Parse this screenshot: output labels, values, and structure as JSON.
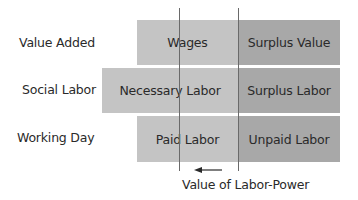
{
  "diagram": {
    "rows": [
      {
        "label": "Value Added",
        "left": {
          "text": "Wages",
          "color": "#c4c4c4"
        },
        "right": {
          "text": "Surplus Value",
          "color": "#a8a8a8"
        }
      },
      {
        "label": "Social Labor",
        "left": {
          "text": "Necessary Labor",
          "color": "#c4c4c4"
        },
        "right": {
          "text": "Surplus Labor",
          "color": "#a8a8a8"
        }
      },
      {
        "label": "Working Day",
        "left": {
          "text": "Paid Labor",
          "color": "#c4c4c4"
        },
        "right": {
          "text": "Unpaid Labor",
          "color": "#a8a8a8"
        }
      }
    ],
    "caption": "Value of Labor-Power",
    "arrow_direction": "left"
  }
}
